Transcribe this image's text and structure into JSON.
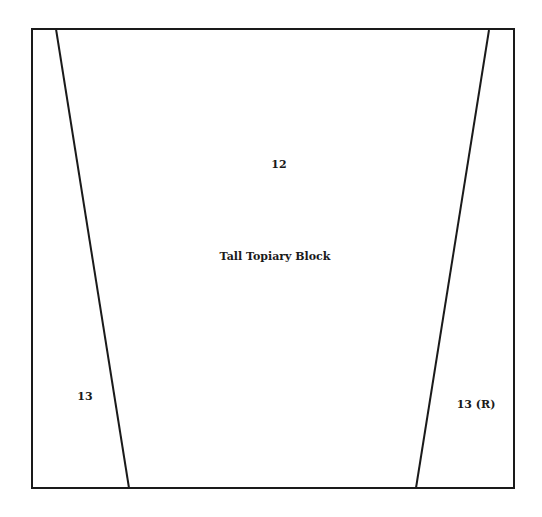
{
  "diagram": {
    "title": "Tall Topiary Block",
    "pieces": [
      {
        "id": "center",
        "label": "12",
        "x": 279,
        "y": 164
      },
      {
        "id": "left",
        "label": "13",
        "x": 85,
        "y": 396
      },
      {
        "id": "right",
        "label": "13 (R)",
        "x": 476,
        "y": 404
      }
    ],
    "title_position": {
      "x": 275,
      "y": 256
    },
    "outline": {
      "left": 32,
      "top": 29,
      "right": 514,
      "bottom": 488
    },
    "left_seam": {
      "x1": 56,
      "y1": 29,
      "x2": 129,
      "y2": 488
    },
    "right_seam": {
      "x1": 489,
      "y1": 30,
      "x2": 416,
      "y2": 488
    },
    "line_color": "#1a1a1a"
  }
}
